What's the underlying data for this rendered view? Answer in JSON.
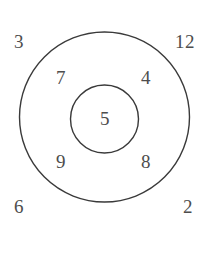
{
  "diagram": {
    "type": "nested-circles",
    "background_color": "#ffffff",
    "stroke_color": "#3a3a3a",
    "stroke_width": 1.4,
    "label_color": "#4d4d4d",
    "outer_circle": {
      "name": "outer-circle",
      "center_x": 104.5,
      "center_y": 117,
      "radius": 85
    },
    "inner_circle": {
      "name": "inner-circle",
      "center_x": 104.5,
      "center_y": 119,
      "radius": 34
    },
    "labels": {
      "outside": [
        {
          "id": "outside-top-left",
          "text": "3",
          "x": 19,
          "y": 41
        },
        {
          "id": "outside-top-right",
          "text": "12",
          "x": 185,
          "y": 41
        },
        {
          "id": "outside-bottom-left",
          "text": "6",
          "x": 19,
          "y": 206
        },
        {
          "id": "outside-bottom-right",
          "text": "2",
          "x": 188,
          "y": 206
        }
      ],
      "ring": [
        {
          "id": "ring-upper-left",
          "text": "7",
          "x": 61,
          "y": 77
        },
        {
          "id": "ring-upper-right",
          "text": "4",
          "x": 146,
          "y": 77
        },
        {
          "id": "ring-lower-left",
          "text": "9",
          "x": 61,
          "y": 161
        },
        {
          "id": "ring-lower-right",
          "text": "8",
          "x": 146,
          "y": 161
        }
      ],
      "center": [
        {
          "id": "center-value",
          "text": "5",
          "x": 105,
          "y": 118
        }
      ]
    }
  }
}
